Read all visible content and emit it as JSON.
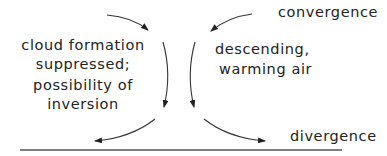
{
  "diagram": {
    "labels": {
      "convergence": "convergence",
      "divergence": "divergence",
      "descending_line1": "descending,",
      "descending_line2": "warming air",
      "cloud_line1": "cloud formation",
      "cloud_line2": "suppressed;",
      "cloud_line3": "possibility of",
      "cloud_line4": "inversion"
    },
    "colors": {
      "stroke": "#333333",
      "text": "#222222",
      "ground": "#555555"
    }
  }
}
